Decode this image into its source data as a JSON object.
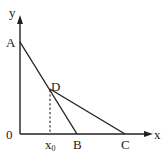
{
  "diagram": {
    "axes": {
      "x_label": "x",
      "y_label": "y",
      "origin_label": "0"
    },
    "points": {
      "A": {
        "label": "A"
      },
      "B": {
        "label": "B"
      },
      "C": {
        "label": "C"
      },
      "D": {
        "label": "D"
      }
    },
    "x0_label": "x",
    "x0_subscript": "0",
    "segments": [
      "AB",
      "DC"
    ],
    "dashed": "D to x0 (perpendicular to x-axis)"
  }
}
